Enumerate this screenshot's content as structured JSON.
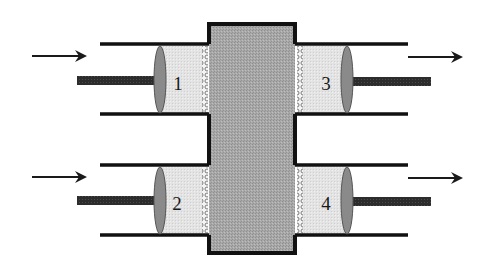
{
  "diagram": {
    "type": "four-cylinder piston / membrane schematic",
    "colors": {
      "background": "#ffffff",
      "outline": "#111111",
      "central_block_fill": "#a4a4a4",
      "chamber_fill": "#e2e2e2",
      "piston_fill": "#8a8a8a",
      "rod_fill": "#2e2e2e",
      "arrow": "#1a1a1a"
    },
    "central_block": {
      "x": 207,
      "y": 22,
      "width": 90,
      "height": 233
    },
    "cylinders": [
      {
        "id": "1",
        "label": "1",
        "side": "left",
        "wall_top": 44,
        "wall_bottom": 114,
        "wall_x1": 100,
        "wall_x2": 207,
        "piston_cx": 160,
        "label_x": 178,
        "label_y": 90,
        "rod_x1": 77,
        "rod_x2": 155,
        "rod_y": 80,
        "arrow": {
          "direction": "right",
          "x1": 32,
          "x2": 86,
          "y": 56
        }
      },
      {
        "id": "3",
        "label": "3",
        "side": "right",
        "wall_top": 44,
        "wall_bottom": 114,
        "wall_x1": 297,
        "wall_x2": 408,
        "piston_cx": 347,
        "label_x": 326,
        "label_y": 90,
        "rod_x1": 352,
        "rod_x2": 431,
        "rod_y": 81,
        "arrow": {
          "direction": "right",
          "x1": 408,
          "x2": 462,
          "y": 57
        }
      },
      {
        "id": "2",
        "label": "2",
        "side": "left",
        "wall_top": 165,
        "wall_bottom": 235,
        "wall_x1": 100,
        "wall_x2": 207,
        "piston_cx": 160,
        "label_x": 177,
        "label_y": 210,
        "rod_x1": 77,
        "rod_x2": 155,
        "rod_y": 200,
        "arrow": {
          "direction": "right",
          "x1": 32,
          "x2": 86,
          "y": 177
        }
      },
      {
        "id": "4",
        "label": "4",
        "side": "right",
        "wall_top": 165,
        "wall_bottom": 235,
        "wall_x1": 297,
        "wall_x2": 408,
        "piston_cx": 347,
        "label_x": 326,
        "label_y": 210,
        "rod_x1": 352,
        "rod_x2": 431,
        "rod_y": 201,
        "arrow": {
          "direction": "right",
          "x1": 408,
          "x2": 462,
          "y": 178
        }
      }
    ],
    "labels": {
      "cyl1": "1",
      "cyl2": "2",
      "cyl3": "3",
      "cyl4": "4"
    },
    "icons": {
      "inflow_arrow": "right-arrow",
      "outflow_arrow": "right-arrow",
      "membrane": "porous-membrane",
      "piston": "piston-disc"
    }
  }
}
